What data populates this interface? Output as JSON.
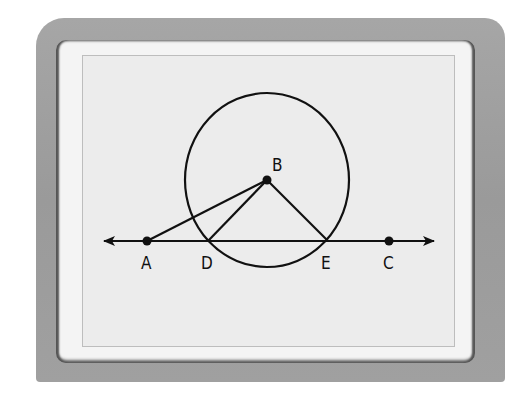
{
  "figure": {
    "points": {
      "A": {
        "label": "A",
        "x": 147,
        "y": 241
      },
      "B": {
        "label": "B",
        "x": 267,
        "y": 180
      },
      "C": {
        "label": "C",
        "x": 389,
        "y": 241
      },
      "D": {
        "label": "D",
        "x": 208,
        "y": 241
      },
      "E": {
        "label": "E",
        "x": 328,
        "y": 241
      }
    },
    "circle": {
      "center": "B",
      "cx": 267,
      "cy": 180,
      "rx": 82,
      "ry": 87
    },
    "line": {
      "name": "AC",
      "x1": 102,
      "x2": 436,
      "y": 241,
      "arrows": "both"
    },
    "segments": [
      "BA",
      "BD",
      "BE"
    ],
    "stroke_color": "#111111",
    "screen_color": "#ececec",
    "bezel_color": "#a0a0a0"
  }
}
